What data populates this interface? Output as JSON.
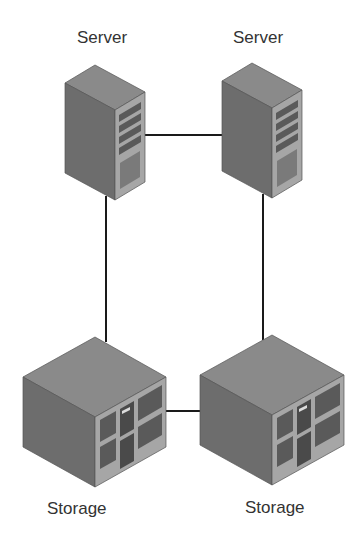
{
  "colors": {
    "background": "#ffffff",
    "device_side": "#6d6d6d",
    "device_top": "#8a8a8a",
    "device_front": "#a6a6a6",
    "panel": "#5a5a5a",
    "link": "#1a1a1a",
    "label": "#333333"
  },
  "nodes": [
    {
      "id": "server-1",
      "type": "server",
      "label": "Server"
    },
    {
      "id": "server-2",
      "type": "server",
      "label": "Server"
    },
    {
      "id": "storage-1",
      "type": "storage",
      "label": "Storage"
    },
    {
      "id": "storage-2",
      "type": "storage",
      "label": "Storage"
    }
  ],
  "links": [
    {
      "from": "server-1",
      "to": "server-2"
    },
    {
      "from": "server-1",
      "to": "storage-1"
    },
    {
      "from": "server-2",
      "to": "storage-2"
    },
    {
      "from": "storage-1",
      "to": "storage-2"
    }
  ]
}
